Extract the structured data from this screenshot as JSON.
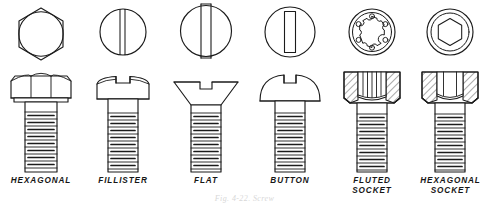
{
  "plate": {
    "title": "Screw and Bolt Head Types",
    "background_color": "#ffffff",
    "line_color": "#1b1b1b",
    "fill_color": "#ffffff",
    "width": 489,
    "height": 205,
    "caption": "Fig. 4-22.  Screw"
  },
  "figures": [
    {
      "key": "hexagonal",
      "label": "HEXAGONAL",
      "top_view": "hexagon-with-chamfer-circle",
      "side_view": "hex-head-bolt",
      "drive": "external-hex",
      "threaded": true,
      "sectioned": false,
      "x": 0,
      "width": 82
    },
    {
      "key": "fillister",
      "label": "FILLISTER",
      "top_view": "circle-with-full-slot",
      "side_view": "fillister-head-screw",
      "drive": "slotted",
      "threaded": true,
      "sectioned": false,
      "x": 82,
      "width": 82
    },
    {
      "key": "flat",
      "label": "FLAT",
      "top_view": "circle-with-wide-slot",
      "side_view": "flat-countersunk-head-screw",
      "drive": "slotted",
      "threaded": true,
      "sectioned": false,
      "x": 164,
      "width": 84
    },
    {
      "key": "button",
      "label": "BUTTON",
      "top_view": "circle-with-inset-slot",
      "side_view": "button-round-head-screw",
      "drive": "slotted",
      "threaded": true,
      "sectioned": false,
      "x": 248,
      "width": 84
    },
    {
      "key": "fluted-socket",
      "label": "FLUTED\nSOCKET",
      "top_view": "concentric-circles-with-fluted-socket",
      "side_view": "fluted-socket-head-cap-screw",
      "drive": "fluted-socket",
      "flutes": 6,
      "threaded": true,
      "sectioned": true,
      "x": 332,
      "width": 80
    },
    {
      "key": "hexagonal-socket",
      "label": "HEXAGONAL\nSOCKET",
      "top_view": "concentric-circles-with-hexagon-socket",
      "side_view": "hexagon-socket-head-cap-screw",
      "drive": "hex-socket",
      "threaded": true,
      "sectioned": true,
      "x": 412,
      "width": 77
    }
  ],
  "layout": {
    "top_view_row_y": 4,
    "side_view_row_y": 68,
    "label_row_y": 176,
    "caption_y": 194
  }
}
